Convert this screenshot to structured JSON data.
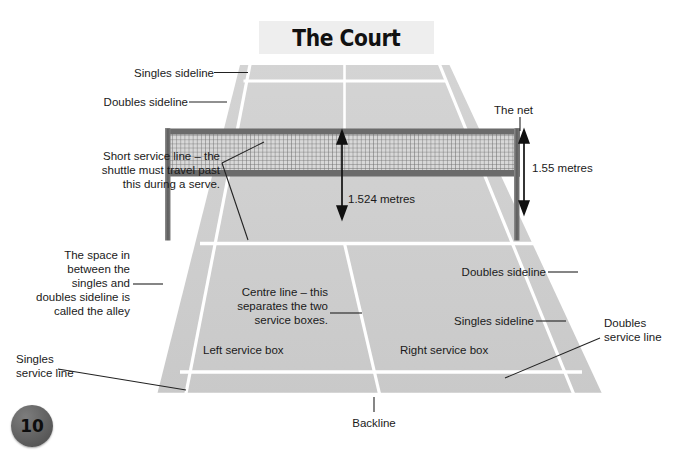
{
  "page": {
    "number": "10",
    "badge_color": "#5a5a5a",
    "background": "#ffffff"
  },
  "title": {
    "text": "The Court",
    "banner_color": "#eeeeee"
  },
  "diagram": {
    "surface_color": "#cccccc",
    "line_color": "#ffffff",
    "net_frame_color": "#6b6b6b",
    "net_mesh_color": "#8a8a8a",
    "arrow_color": "#111111",
    "leader_color": "#222222"
  },
  "labels": {
    "singles_sideline_top": "Singles sideline",
    "doubles_sideline_top": "Doubles sideline",
    "the_net": "The net",
    "height_at_post": "1.55 metres",
    "height_at_centre": "1.524 metres",
    "short_service_line": "Short service line – the\nshuttle must travel past\nthis during a serve.",
    "alley": "The space in\nbetween the\nsingles and\ndoubles sideline is\ncalled the alley",
    "singles_service_line": "Singles\nservice line",
    "centre_line": "Centre line – this\nseparates the two\nservice boxes.",
    "left_service_box": "Left service box",
    "right_service_box": "Right service box",
    "doubles_sideline_right": "Doubles sideline",
    "singles_sideline_right": "Singles sideline",
    "doubles_service_line": "Doubles\nservice line",
    "backline": "Backline"
  }
}
